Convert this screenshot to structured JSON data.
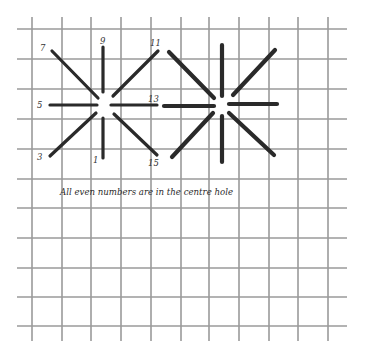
{
  "diagram": {
    "type": "needlepoint-stitch-diagram",
    "caption": "All even numbers are in the centre hole",
    "colors": {
      "background": "#ffffff",
      "grid": "#9a9a9a",
      "stitch": "#2a2a2a",
      "text": "#333333"
    },
    "grid": {
      "vertical_x": [
        32,
        62,
        91,
        121,
        151,
        181,
        209,
        239,
        269,
        298,
        328
      ],
      "horizontal_y": [
        29,
        59,
        89,
        119,
        149,
        179,
        208,
        238,
        268,
        297,
        326
      ],
      "x_extent": [
        17,
        347
      ],
      "y_extent": [
        17,
        341
      ]
    },
    "stars": [
      {
        "name": "numbered-star",
        "center": [
          103,
          105
        ],
        "stroke_width": 3.2,
        "stitches": [
          {
            "label": "1",
            "from": [
              103,
              158
            ],
            "to": [
              103,
              118
            ],
            "label_pos": [
              93,
              163
            ]
          },
          {
            "label": "3",
            "from": [
              50,
              156
            ],
            "to": [
              96,
              113
            ],
            "label_pos": [
              37,
              160
            ]
          },
          {
            "label": "5",
            "from": [
              50,
              105
            ],
            "to": [
              97,
              105
            ],
            "label_pos": [
              37,
              108
            ]
          },
          {
            "label": "7",
            "from": [
              52,
              51
            ],
            "to": [
              98,
              98
            ],
            "label_pos": [
              40,
              51
            ]
          },
          {
            "label": "9",
            "from": [
              103,
              47
            ],
            "to": [
              103,
              92
            ],
            "label_pos": [
              100,
              44
            ]
          },
          {
            "label": "11",
            "from": [
              158,
              51
            ],
            "to": [
              113,
              96
            ],
            "label_pos": [
              150,
              46
            ]
          },
          {
            "label": "13",
            "from": [
              157,
              105
            ],
            "to": [
              111,
              105
            ],
            "label_pos": [
              148,
              102
            ]
          },
          {
            "label": "15",
            "from": [
              157,
              155
            ],
            "to": [
              114,
              114
            ],
            "label_pos": [
              148,
              166
            ]
          }
        ]
      },
      {
        "name": "completed-star",
        "center": [
          222,
          105
        ],
        "stroke_width": 4.2,
        "stitches": [
          {
            "from": [
              222,
              45
            ],
            "to": [
              222,
              96
            ]
          },
          {
            "from": [
              222,
              162
            ],
            "to": [
              222,
              116
            ]
          },
          {
            "from": [
              164,
              106
            ],
            "to": [
              214,
              106
            ]
          },
          {
            "from": [
              277,
              104
            ],
            "to": [
              229,
              104
            ]
          },
          {
            "from": [
              169,
              52
            ],
            "to": [
              214,
              98
            ]
          },
          {
            "from": [
              275,
              50
            ],
            "to": [
              233,
              95
            ]
          },
          {
            "from": [
              172,
              157
            ],
            "to": [
              213,
              113
            ]
          },
          {
            "from": [
              274,
              155
            ],
            "to": [
              229,
              113
            ]
          }
        ]
      }
    ],
    "caption_pos": [
      60,
      195
    ]
  }
}
